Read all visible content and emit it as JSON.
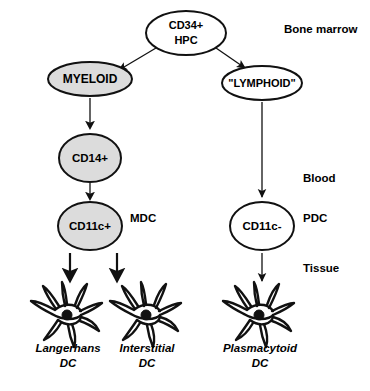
{
  "figure": {
    "background_color": "#ffffff",
    "stroke_color": "#111111",
    "fill_gray": "#dcdcdc",
    "fill_white": "#ffffff"
  },
  "nodes": {
    "hpc": {
      "line1": "CD34+",
      "line2": "HPC",
      "shape": "ellipse",
      "fill": "white"
    },
    "myeloid": {
      "label": "MYELOID",
      "shape": "ellipse",
      "fill": "gray"
    },
    "lymphoid": {
      "label": "\"LYMPHOID\"",
      "shape": "ellipse",
      "fill": "white"
    },
    "cd14": {
      "label": "CD14+",
      "shape": "ellipse",
      "fill": "gray"
    },
    "cd11c_pos": {
      "label": "CD11c+",
      "shape": "ellipse",
      "fill": "gray"
    },
    "cd11c_neg": {
      "label": "CD11c-",
      "shape": "ellipse",
      "fill": "white"
    }
  },
  "annotations": {
    "mdc": "MDC",
    "pdc": "PDC"
  },
  "compartments": {
    "bone_marrow": "Bone marrow",
    "blood": "Blood",
    "tissue": "Tissue"
  },
  "cells": [
    {
      "name_line1": "Langerhans",
      "name_line2": "DC"
    },
    {
      "name_line1": "Interstitial",
      "name_line2": "DC"
    },
    {
      "name_line1": "Plasmacytoid",
      "name_line2": "DC"
    }
  ]
}
